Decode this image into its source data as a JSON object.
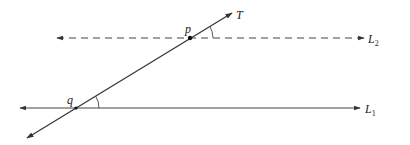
{
  "diagram": {
    "type": "parallel-lines-transversal",
    "colors": {
      "line": "#333333",
      "point": "#111111",
      "text": "#222222"
    },
    "lines": {
      "L1": {
        "label": "L",
        "subscript": "1",
        "style": "solid",
        "y": 108,
        "x1": 20,
        "x2": 360
      },
      "L2": {
        "label": "L",
        "subscript": "2",
        "style": "dashed",
        "y": 38,
        "x1": 57,
        "x2": 364
      },
      "T": {
        "label": "T",
        "style": "solid",
        "x1": 27,
        "y1": 138,
        "x2": 232,
        "y2": 13
      }
    },
    "points": {
      "p": {
        "label": "p",
        "x": 190,
        "y": 38
      },
      "q": {
        "label": "q",
        "x": 76,
        "y": 108
      }
    },
    "angles": [
      {
        "at": "p",
        "between": [
          "T",
          "L2"
        ],
        "radius": 23
      },
      {
        "at": "q",
        "between": [
          "T",
          "L1"
        ],
        "radius": 23
      }
    ]
  }
}
